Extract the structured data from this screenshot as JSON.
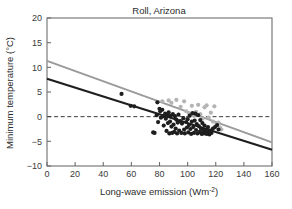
{
  "chart_data": {
    "type": "scatter",
    "title": "Roll, Arizona",
    "xlabel": "Long-wave emission (Wm",
    "xlabel_sup": "-2",
    "xlabel_tail": ")",
    "ylabel": "Minimum temperature (°C)",
    "xlim": [
      0,
      160
    ],
    "ylim": [
      -10,
      20
    ],
    "xticks": [
      0,
      20,
      40,
      60,
      80,
      100,
      120,
      140,
      160
    ],
    "yticks": [
      20,
      15,
      10,
      5,
      0,
      -5,
      -10
    ],
    "xtick_labels": [
      "0",
      "20",
      "40",
      "60",
      "80",
      "100",
      "120",
      "140",
      "160"
    ],
    "ytick_labels": [
      "20",
      "15",
      "10",
      "5",
      "0",
      "−5",
      "−10"
    ],
    "grid": false,
    "legend": "none",
    "zero_reference_line": {
      "y": 0,
      "style": "dashed",
      "color": "#3a3a3a"
    },
    "frame": {
      "box": true,
      "color": "#6e6e6e"
    },
    "series": [
      {
        "name": "dark-series",
        "color": "#1e1e1e",
        "marker": "circle",
        "marker_size": 2.1,
        "points": [
          [
            53.0,
            4.6
          ],
          [
            59.5,
            2.2
          ],
          [
            62.0,
            2.1
          ],
          [
            75.5,
            -3.2
          ],
          [
            76.5,
            -3.3
          ],
          [
            78.0,
            0.3
          ],
          [
            78.5,
            2.9
          ],
          [
            79.0,
            -1.1
          ],
          [
            80.0,
            1.6
          ],
          [
            80.5,
            1.1
          ],
          [
            81.0,
            -0.2
          ],
          [
            82.0,
            1.4
          ],
          [
            82.5,
            0.1
          ],
          [
            83.0,
            -1.8
          ],
          [
            84.0,
            0.6
          ],
          [
            84.5,
            -0.4
          ],
          [
            85.0,
            -2.9
          ],
          [
            85.5,
            0.4
          ],
          [
            86.0,
            -1.3
          ],
          [
            86.5,
            0.9
          ],
          [
            87.0,
            -3.4
          ],
          [
            87.5,
            -1.0
          ],
          [
            88.0,
            0.2
          ],
          [
            88.5,
            -2.0
          ],
          [
            89.0,
            -3.3
          ],
          [
            89.5,
            0.5
          ],
          [
            90.0,
            -1.6
          ],
          [
            90.5,
            -3.1
          ],
          [
            91.0,
            0.1
          ],
          [
            91.5,
            -2.4
          ],
          [
            92.0,
            -0.6
          ],
          [
            92.5,
            -3.4
          ],
          [
            93.0,
            -1.2
          ],
          [
            93.5,
            0.4
          ],
          [
            94.0,
            -2.8
          ],
          [
            95.0,
            -0.9
          ],
          [
            95.5,
            -3.3
          ],
          [
            96.0,
            -1.4
          ],
          [
            97.0,
            -0.3
          ],
          [
            97.5,
            -2.6
          ],
          [
            98.0,
            -3.4
          ],
          [
            99.0,
            -1.1
          ],
          [
            99.5,
            -2.2
          ],
          [
            100.0,
            -0.5
          ],
          [
            100.5,
            -3.2
          ],
          [
            101.0,
            -1.7
          ],
          [
            101.5,
            0.2
          ],
          [
            102.0,
            -2.5
          ],
          [
            102.5,
            -3.5
          ],
          [
            103.0,
            -1.0
          ],
          [
            103.5,
            0.7
          ],
          [
            104.0,
            -2.1
          ],
          [
            104.5,
            -3.3
          ],
          [
            105.0,
            -0.8
          ],
          [
            105.5,
            0.6
          ],
          [
            106.0,
            -2.7
          ],
          [
            106.5,
            -1.5
          ],
          [
            107.0,
            -3.4
          ],
          [
            107.5,
            0.3
          ],
          [
            108.0,
            -1.9
          ],
          [
            108.5,
            -3.1
          ],
          [
            109.0,
            -0.7
          ],
          [
            109.5,
            -2.4
          ],
          [
            110.0,
            -3.5
          ],
          [
            110.5,
            -1.3
          ],
          [
            111.0,
            -2.9
          ],
          [
            111.5,
            -3.4
          ],
          [
            112.0,
            -1.8
          ],
          [
            112.5,
            -3.3
          ],
          [
            113.0,
            -2.6
          ],
          [
            113.5,
            -3.5
          ],
          [
            114.0,
            -3.2
          ],
          [
            114.5,
            -2.1
          ],
          [
            115.0,
            -3.4
          ],
          [
            115.5,
            -3.6
          ],
          [
            116.0,
            -2.8
          ],
          [
            117.0,
            -3.3
          ],
          [
            118.0,
            -2.4
          ],
          [
            119.5,
            -2.1
          ],
          [
            121.0,
            -1.7
          ],
          [
            122.0,
            -2.6
          ]
        ]
      },
      {
        "name": "light-series",
        "color": "#b4b4b4",
        "marker": "circle",
        "marker_size": 2.1,
        "points": [
          [
            82.0,
            3.1
          ],
          [
            86.5,
            3.3
          ],
          [
            88.5,
            2.8
          ],
          [
            92.0,
            3.4
          ],
          [
            95.0,
            2.0
          ],
          [
            97.5,
            3.1
          ],
          [
            99.0,
            1.1
          ],
          [
            101.0,
            0.6
          ],
          [
            103.0,
            2.2
          ],
          [
            104.5,
            0.2
          ],
          [
            106.0,
            1.0
          ],
          [
            107.5,
            2.4
          ],
          [
            109.0,
            0.5
          ],
          [
            110.5,
            -0.4
          ],
          [
            112.0,
            1.9
          ],
          [
            113.5,
            2.3
          ],
          [
            115.0,
            -0.2
          ],
          [
            116.5,
            0.8
          ],
          [
            118.0,
            -1.0
          ],
          [
            119.0,
            2.1
          ],
          [
            120.5,
            -1.6
          ],
          [
            122.0,
            -1.2
          ],
          [
            123.0,
            -2.2
          ],
          [
            124.0,
            -2.6
          ]
        ]
      }
    ],
    "fit_lines": [
      {
        "name": "dark-fit",
        "color": "#1e1e1e",
        "width": 2.2,
        "x0": 0,
        "y0": 7.7,
        "x1": 160,
        "y1": -6.7
      },
      {
        "name": "light-fit",
        "color": "#9a9a9a",
        "width": 2.0,
        "x0": 0,
        "y0": 11.3,
        "x1": 160,
        "y1": -5.2
      }
    ]
  }
}
